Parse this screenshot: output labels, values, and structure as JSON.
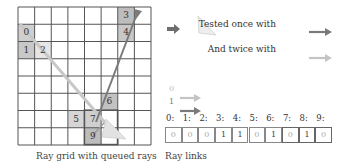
{
  "grid": {
    "caption": "Ray grid with queued rays",
    "cols": 8,
    "rows": 8,
    "cells": [
      {
        "label": "0",
        "col": 0,
        "row": 1,
        "shade": "#cfcfcf"
      },
      {
        "label": "1",
        "col": 0,
        "row": 2,
        "shade": "#c8c8c8"
      },
      {
        "label": "2",
        "col": 1,
        "row": 2,
        "shade": "#e6e6e6"
      },
      {
        "label": "3",
        "col": 6,
        "row": 0,
        "shade": "#bdbdbd"
      },
      {
        "label": "4",
        "col": 6,
        "row": 1,
        "shade": "#c8c8c8"
      },
      {
        "label": "5",
        "col": 3,
        "row": 6,
        "shade": "#d6d6d6"
      },
      {
        "label": "6",
        "col": 5,
        "row": 5,
        "shade": "#c2c2c2"
      },
      {
        "label": "7",
        "col": 4,
        "row": 6,
        "shade": "#cfcfcf"
      },
      {
        "label": "9",
        "col": 4,
        "row": 7,
        "shade": "#bdbdbd"
      }
    ]
  },
  "legend": {
    "once_label": "Tested once with",
    "twice_label": "And twice with",
    "once_color": "#7a7a7a",
    "twice_color": "#c4c4c4",
    "arrow_icon_color": "#6e6e6e"
  },
  "links": {
    "caption": "Ray links",
    "key": [
      {
        "label": "0",
        "color": "#c4c4c4"
      },
      {
        "label": "1",
        "color": "#7a7a7a"
      }
    ],
    "indices": [
      "0:",
      "1:",
      "2:",
      "3:",
      "4:",
      "5:",
      "6:",
      "7:",
      "8:",
      "9:"
    ],
    "values": [
      "0",
      "0",
      "0",
      "1",
      "1",
      "0",
      "1",
      "0",
      "1",
      "0"
    ]
  }
}
